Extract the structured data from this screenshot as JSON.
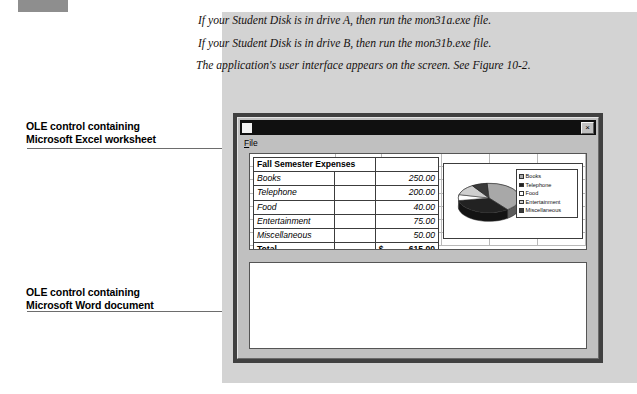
{
  "figure": {
    "instructions": [
      "If your Student Disk is in drive A, then run the mon31a.exe file.",
      "If your Student Disk is in drive B, then run the mon31b.exe file.",
      "The application's user interface appears on the screen. See Figure 10-2."
    ]
  },
  "callouts": {
    "excel": {
      "line1": "OLE control containing",
      "line2": "Microsoft Excel worksheet"
    },
    "word": {
      "line1": "OLE control containing",
      "line2": "Microsoft Word document"
    }
  },
  "window": {
    "title": "",
    "icon": "document-icon",
    "close_label": "×",
    "menu": [
      {
        "label": "File",
        "accel": "F",
        "rest": "ile"
      }
    ]
  },
  "worksheet": {
    "title": "Fall Semester Expenses",
    "rows": [
      {
        "label": "Books",
        "amount": "250.00"
      },
      {
        "label": "Telephone",
        "amount": "200.00"
      },
      {
        "label": "Food",
        "amount": "40.00"
      },
      {
        "label": "Entertainment",
        "amount": "75.00"
      },
      {
        "label": "Miscellaneous",
        "amount": "50.00"
      }
    ],
    "total": {
      "label": "Total",
      "currency": "$",
      "amount": "615.00"
    }
  },
  "chart_data": {
    "type": "pie",
    "title": "",
    "categories": [
      "Books",
      "Telephone",
      "Food",
      "Entertainment",
      "Miscellaneous"
    ],
    "values": [
      250,
      200,
      40,
      75,
      50
    ],
    "total": 615,
    "colors": [
      "#a8a8a8",
      "#222222",
      "#ffffff",
      "#cfcfcf",
      "#3a3a3a"
    ],
    "legend_position": "right",
    "legend": [
      "Books",
      "Telephone",
      "Food",
      "Entertainment",
      "Miscellaneous"
    ],
    "xlabel": "",
    "ylabel": ""
  },
  "word_document": {
    "content": ""
  }
}
